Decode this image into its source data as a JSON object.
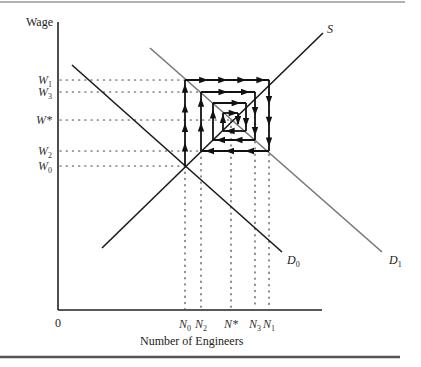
{
  "diagram": {
    "colors": {
      "axis": "#222222",
      "supply": "#1a1a1a",
      "demand0": "#1a1a1a",
      "demand1": "#777777",
      "cobweb": "#111111",
      "guides": "#444444",
      "rule_top": "#999999",
      "rule_bottom": "#555555"
    },
    "axes": {
      "y_title": "Wage",
      "x_title": "Number of Engineers",
      "origin_label": "0"
    },
    "wage_levels": [
      {
        "base": "W",
        "sub": "1",
        "y": 80
      },
      {
        "base": "W",
        "sub": "3",
        "y": 92
      },
      {
        "base": "W*",
        "sub": "",
        "y": 120
      },
      {
        "base": "W",
        "sub": "2",
        "y": 151
      },
      {
        "base": "W",
        "sub": "0",
        "y": 166
      }
    ],
    "employment_levels": [
      {
        "base": "N",
        "sub": "0",
        "x": 185
      },
      {
        "base": "N",
        "sub": "2",
        "x": 201
      },
      {
        "base": "N*",
        "sub": "",
        "x": 231
      },
      {
        "base": "N",
        "sub": "3",
        "x": 255
      },
      {
        "base": "N",
        "sub": "1",
        "x": 269
      }
    ],
    "curves": {
      "supply": {
        "label": "S",
        "from": [
          102,
          248
        ],
        "to": [
          323,
          33
        ]
      },
      "demand0": {
        "label_base": "D",
        "label_sub": "0",
        "from": [
          72,
          65
        ],
        "to": [
          282,
          252
        ]
      },
      "demand1": {
        "label_base": "D",
        "label_sub": "1",
        "from": [
          150,
          48
        ],
        "to": [
          382,
          252
        ]
      }
    },
    "cobweb_path": [
      [
        185,
        166
      ],
      [
        185,
        80
      ],
      [
        269,
        80
      ],
      [
        269,
        151
      ],
      [
        201,
        151
      ],
      [
        201,
        92
      ],
      [
        255,
        92
      ],
      [
        255,
        140
      ],
      [
        213,
        140
      ],
      [
        213,
        103
      ],
      [
        246,
        103
      ],
      [
        246,
        131
      ],
      [
        223,
        131
      ],
      [
        223,
        113
      ],
      [
        238,
        113
      ],
      [
        238,
        124
      ]
    ]
  }
}
